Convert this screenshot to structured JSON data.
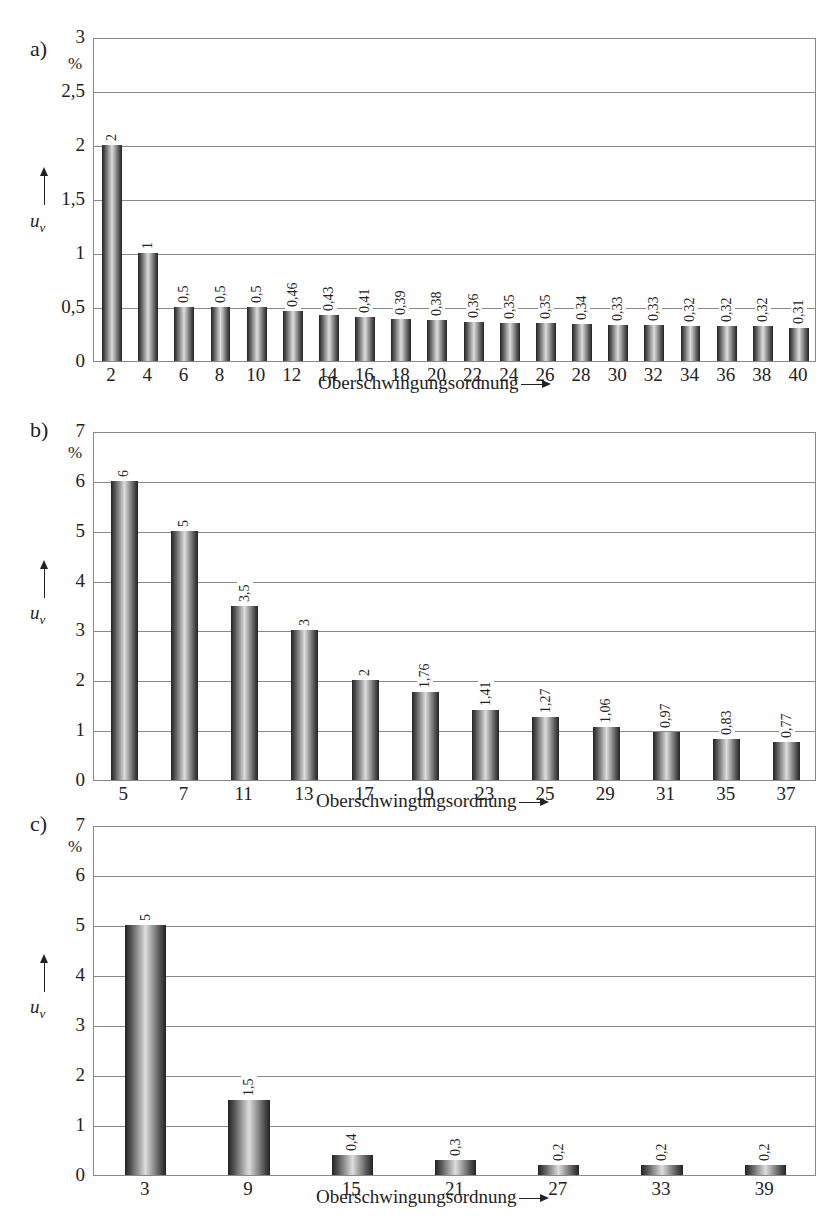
{
  "chart_data": [
    {
      "panel": "a)",
      "type": "bar",
      "categories": [
        "2",
        "4",
        "6",
        "8",
        "10",
        "12",
        "14",
        "16",
        "18",
        "20",
        "22",
        "24",
        "26",
        "28",
        "30",
        "32",
        "34",
        "36",
        "38",
        "40"
      ],
      "values": [
        2,
        1,
        0.5,
        0.5,
        0.5,
        0.46,
        0.43,
        0.41,
        0.39,
        0.38,
        0.36,
        0.35,
        0.35,
        0.34,
        0.33,
        0.33,
        0.32,
        0.32,
        0.32,
        0.31
      ],
      "value_labels": [
        "2",
        "1",
        "0,5",
        "0,5",
        "0,5",
        "0,46",
        "0,43",
        "0,41",
        "0,39",
        "0,38",
        "0,36",
        "0,35",
        "0,35",
        "0,34",
        "0,33",
        "0,33",
        "0,32",
        "0,32",
        "0,32",
        "0,31"
      ],
      "xlabel": "Oberschwingungsordnung",
      "ylabel": "u_v",
      "yunit": "%",
      "ylim": [
        0,
        3
      ],
      "yticks": [
        "0",
        "0,5",
        "1",
        "1,5",
        "2",
        "2,5",
        "3"
      ],
      "grid": true
    },
    {
      "panel": "b)",
      "type": "bar",
      "categories": [
        "5",
        "7",
        "11",
        "13",
        "17",
        "19",
        "23",
        "25",
        "29",
        "31",
        "35",
        "37"
      ],
      "values": [
        6,
        5,
        3.5,
        3,
        2,
        1.76,
        1.41,
        1.27,
        1.06,
        0.97,
        0.83,
        0.77
      ],
      "value_labels": [
        "6",
        "5",
        "3,5",
        "3",
        "2",
        "1,76",
        "1,41",
        "1,27",
        "1,06",
        "0,97",
        "0,83",
        "0,77"
      ],
      "xlabel": "Oberschwingungsordnung",
      "ylabel": "u_v",
      "yunit": "%",
      "ylim": [
        0,
        7
      ],
      "yticks": [
        "0",
        "1",
        "2",
        "3",
        "4",
        "5",
        "6",
        "7"
      ],
      "grid": true
    },
    {
      "panel": "c)",
      "type": "bar",
      "categories": [
        "3",
        "9",
        "15",
        "21",
        "27",
        "33",
        "39"
      ],
      "values": [
        5,
        1.5,
        0.4,
        0.3,
        0.2,
        0.2,
        0.2
      ],
      "value_labels": [
        "5",
        "1,5",
        "0,4",
        "0,3",
        "0,2",
        "0,2",
        "0,2"
      ],
      "xlabel": "Oberschwingungsordnung",
      "ylabel": "u_v",
      "yunit": "%",
      "ylim": [
        0,
        7
      ],
      "yticks": [
        "0",
        "1",
        "2",
        "3",
        "4",
        "5",
        "6",
        "7"
      ],
      "grid": true
    }
  ],
  "panels": [
    {
      "label": "a)",
      "unit": "%",
      "ylabel": "u",
      "ysub": "v",
      "xtitle": "Oberschwingungsordnung"
    },
    {
      "label": "b)",
      "unit": "%",
      "ylabel": "u",
      "ysub": "v",
      "xtitle": "Oberschwingungsordnung"
    },
    {
      "label": "c)",
      "unit": "%",
      "ylabel": "u",
      "ysub": "v",
      "xtitle": "Oberschwingungsordnung"
    }
  ]
}
